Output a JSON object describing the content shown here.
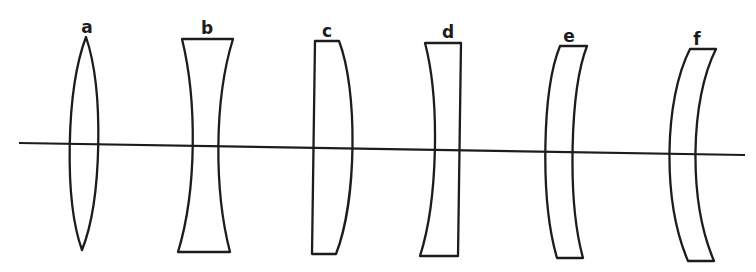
{
  "diagram": {
    "background": "#ffffff",
    "stroke_color": "#1c1c1c",
    "optical_axis": {
      "x1": 19,
      "y1": 143,
      "x2": 745,
      "y2": 155
    },
    "lenses": [
      {
        "label": "a",
        "type": "biconvex",
        "label_pos": [
          87,
          31
        ]
      },
      {
        "label": "b",
        "type": "biconcave",
        "label_pos": [
          207,
          32
        ]
      },
      {
        "label": "c",
        "type": "plano-convex",
        "label_pos": [
          327,
          36
        ]
      },
      {
        "label": "d",
        "type": "plano-concave",
        "label_pos": [
          448,
          37
        ]
      },
      {
        "label": "e",
        "type": "positive meniscus",
        "label_pos": [
          569,
          41
        ]
      },
      {
        "label": "f",
        "type": "negative meniscus",
        "label_pos": [
          697,
          44
        ]
      }
    ]
  }
}
